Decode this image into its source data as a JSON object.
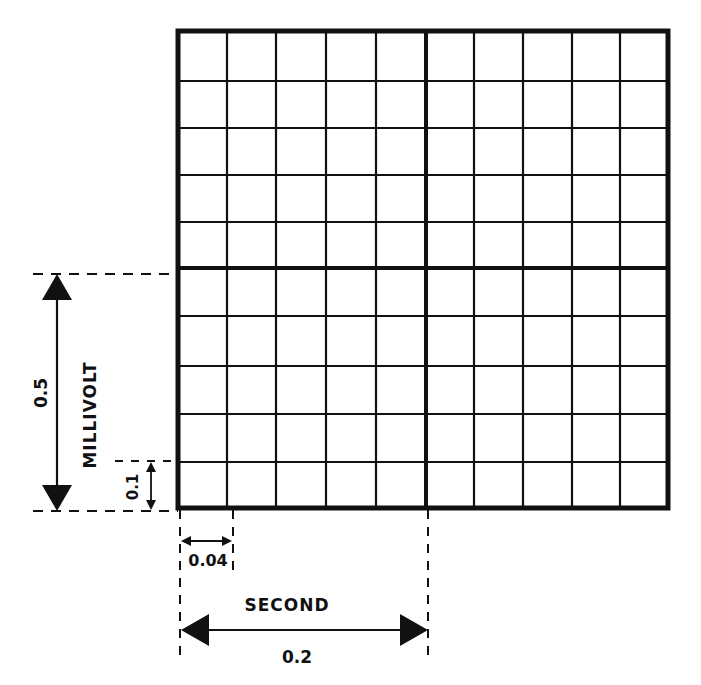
{
  "diagram": {
    "type": "ECG grid calibration diagram",
    "grid": {
      "columns": 10,
      "rows": 10,
      "major_every": 5,
      "line_color": "#111111",
      "background": "#ffffff"
    },
    "vertical_scale": {
      "unit_label": "MILLIVOLT",
      "major_value": "0.5",
      "minor_value": "0.1"
    },
    "horizontal_scale": {
      "unit_label": "SECOND",
      "major_value": "0.2",
      "minor_value": "0.04"
    }
  }
}
